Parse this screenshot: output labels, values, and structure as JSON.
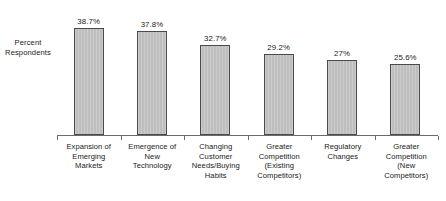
{
  "chart_data": {
    "type": "bar",
    "title": "",
    "xlabel": "",
    "ylabel": "Percent Respondents",
    "ylim": [
      0,
      42
    ],
    "grid": false,
    "legend": false,
    "categories": [
      "Expansion of Emerging Markets",
      "Emergence of New Technology",
      "Changing Customer Needs/Buying Habits",
      "Greater Competition (Existing Competitors)",
      "Regulatory Changes",
      "Greater Competition (New Competitors)"
    ],
    "values": [
      38.7,
      37.8,
      32.7,
      29.2,
      27,
      25.6
    ],
    "value_labels": [
      "38.7%",
      "37.8%",
      "32.7%",
      "29.2%",
      "27%",
      "25.6%"
    ],
    "category_lines": [
      [
        "Expansion of",
        "Emerging",
        "Markets"
      ],
      [
        "Emergence of",
        "New",
        "Technology"
      ],
      [
        "Changing",
        "Customer",
        "Needs/Buying",
        "Habits"
      ],
      [
        "Greater",
        "Competition",
        "(Existing",
        "Competitors)"
      ],
      [
        "Regulatory",
        "Changes"
      ],
      [
        "Greater",
        "Competition",
        "(New",
        "Competitors)"
      ]
    ],
    "colors": {
      "bar_fill": "#c2c2c2",
      "bar_border": "#4a4a4a",
      "axis": "#6b6b6b",
      "text": "#1a1a1a",
      "background": "#ffffff"
    }
  },
  "axis_caption": {
    "line1": "Percent",
    "line2": "Respondents"
  }
}
